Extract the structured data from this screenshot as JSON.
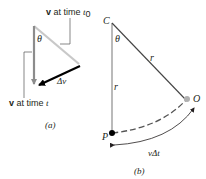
{
  "figure": {
    "panel_a": {
      "label_v_t0_bold": "v",
      "label_v_t0_text": " at time ",
      "label_v_t0_time": "t",
      "label_v_t0_sub": "0",
      "label_v_t_bold": "v",
      "label_v_t_text": " at time ",
      "label_v_t_time": "t",
      "theta": "θ",
      "delta_v": "Δv",
      "caption": "(a)"
    },
    "panel_b": {
      "point_c": "C",
      "point_o": "O",
      "point_p": "P",
      "theta": "θ",
      "radius_diag": "r",
      "radius_vert": "r",
      "arc_label": "vΔt",
      "caption": "(b)"
    },
    "colors": {
      "v_t0_arrow": "#c8c8c8",
      "v_t_arrow": "#8c8c8c",
      "delta_v_arrow": "#000000",
      "radius_line": "#555555",
      "point_o": "#b0b0b0",
      "point_p": "#000000"
    }
  }
}
